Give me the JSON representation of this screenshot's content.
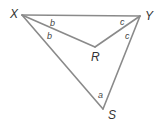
{
  "diagram": {
    "type": "geometry",
    "vertices": [
      {
        "id": "X",
        "label": "X"
      },
      {
        "id": "Y",
        "label": "Y"
      },
      {
        "id": "R",
        "label": "R"
      },
      {
        "id": "S",
        "label": "S"
      }
    ],
    "edges": [
      {
        "from": "X",
        "to": "Y"
      },
      {
        "from": "X",
        "to": "S"
      },
      {
        "from": "Y",
        "to": "S"
      },
      {
        "from": "X",
        "to": "R"
      },
      {
        "from": "Y",
        "to": "R"
      }
    ],
    "angle_labels": [
      {
        "label": "b",
        "at": "X",
        "between": [
          "XY",
          "XR"
        ]
      },
      {
        "label": "b",
        "at": "X",
        "between": [
          "XR",
          "XS"
        ]
      },
      {
        "label": "c",
        "at": "Y",
        "between": [
          "YX",
          "YR"
        ]
      },
      {
        "label": "c",
        "at": "Y",
        "between": [
          "YR",
          "YS"
        ]
      },
      {
        "label": "a",
        "at": "S",
        "between": [
          "SX",
          "SY"
        ]
      }
    ],
    "colors": {
      "line": "#8a8a8a",
      "text": "#333333",
      "background": "#ffffff"
    }
  }
}
